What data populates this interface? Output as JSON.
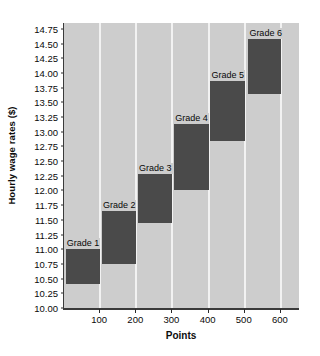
{
  "chart_data": {
    "type": "bar",
    "title": "",
    "xlabel": "Points",
    "ylabel": "Hourly wage rates ($)",
    "xlim": [
      0,
      650
    ],
    "ylim": [
      10.0,
      14.85
    ],
    "grid": "vertical-white-gridlines-at-x-ticks",
    "legend": "none",
    "orientation": "stepped-range-bars",
    "x_ticks": [
      100,
      200,
      300,
      400,
      500,
      600
    ],
    "x_tick_labels": [
      "100",
      "200",
      "300",
      "400",
      "500",
      "600"
    ],
    "y_ticks": [
      10.0,
      10.25,
      10.5,
      10.75,
      11.0,
      11.25,
      11.5,
      11.75,
      12.0,
      12.25,
      12.5,
      12.75,
      13.0,
      13.25,
      13.5,
      13.75,
      14.0,
      14.25,
      14.5,
      14.75
    ],
    "y_tick_labels": [
      "10.00",
      "10.25",
      "10.50",
      "10.75",
      "11.00",
      "11.25",
      "11.50",
      "11.75",
      "12.00",
      "12.25",
      "12.50",
      "12.75",
      "13.00",
      "13.25",
      "13.50",
      "13.75",
      "14.00",
      "14.25",
      "14.50",
      "14.75"
    ],
    "series": [
      {
        "name": "Grade wage ranges",
        "bars": [
          {
            "label": "Grade 1",
            "x_start": 5,
            "x_end": 100,
            "y_min": 10.4,
            "y_max": 11.0
          },
          {
            "label": "Grade 2",
            "x_start": 105,
            "x_end": 200,
            "y_min": 10.75,
            "y_max": 11.65
          },
          {
            "label": "Grade 3",
            "x_start": 205,
            "x_end": 300,
            "y_min": 11.45,
            "y_max": 12.28
          },
          {
            "label": "Grade 4",
            "x_start": 305,
            "x_end": 400,
            "y_min": 12.0,
            "y_max": 13.13
          },
          {
            "label": "Grade 5",
            "x_start": 405,
            "x_end": 500,
            "y_min": 12.85,
            "y_max": 13.87
          },
          {
            "label": "Grade 6",
            "x_start": 510,
            "x_end": 600,
            "y_min": 13.65,
            "y_max": 14.57
          }
        ]
      }
    ],
    "colors": {
      "bar_fill": "#4a4a4a",
      "plot_background": "#cdcdcd",
      "gridline": "#f2f2f2",
      "axis": "#3a3a3a",
      "text": "#0a0a0a",
      "page_background": "#ffffff"
    }
  }
}
